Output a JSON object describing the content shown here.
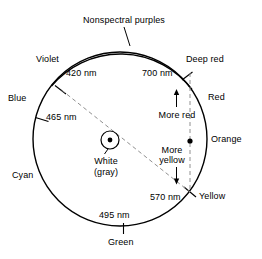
{
  "figure": {
    "title_label": "Nonspectral purples",
    "center_label_line1": "White",
    "center_label_line2": "(gray)",
    "direction_more_red": "More red",
    "direction_more_yellow_line1": "More",
    "direction_more_yellow_line2": "yellow",
    "colors": {
      "stroke": "#000000",
      "dashed": "#888888",
      "background": "#ffffff"
    }
  },
  "hues": [
    {
      "name": "violet-label",
      "label": "Violet"
    },
    {
      "name": "blue-label",
      "label": "Blue"
    },
    {
      "name": "cyan-label",
      "label": "Cyan"
    },
    {
      "name": "green-label",
      "label": "Green"
    },
    {
      "name": "yellow-label",
      "label": "Yellow"
    },
    {
      "name": "orange-label",
      "label": "Orange"
    },
    {
      "name": "red-label",
      "label": "Red"
    },
    {
      "name": "deep-red-label",
      "label": "Deep red"
    }
  ],
  "wavelengths": [
    {
      "name": "violet-wavelength",
      "label": "420 nm"
    },
    {
      "name": "blue-wavelength",
      "label": "465 nm"
    },
    {
      "name": "green-wavelength",
      "label": "495 nm"
    },
    {
      "name": "yellow-wavelength",
      "label": "570 nm"
    },
    {
      "name": "deep-red-wavelength",
      "label": "700 nm"
    }
  ]
}
